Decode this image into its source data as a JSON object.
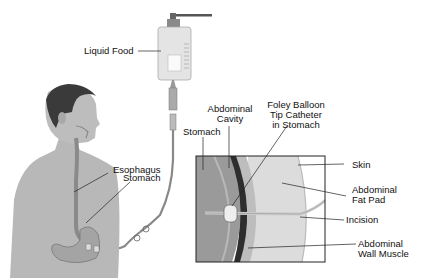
{
  "diagram": {
    "type": "medical-illustration"
  },
  "labels": {
    "liquid_food": "Liquid Food",
    "esophagus": "Esophagus",
    "stomach_body": "Stomach",
    "stomach_inset": "Stomach",
    "abdominal_cavity_1": "Abdominal",
    "abdominal_cavity_2": "Cavity",
    "foley_1": "Foley Balloon",
    "foley_2": "Tip Catheter",
    "foley_3": "in Stomach",
    "skin": "Skin",
    "fat_pad_1": "Abdominal",
    "fat_pad_2": "Fat Pad",
    "incision": "Incision",
    "wall_muscle_1": "Abdominal",
    "wall_muscle_2": "Wall Muscle"
  },
  "colors": {
    "skin_tone": "#b8b8b8",
    "hair": "#3a3a3a",
    "stomach": "#9a9a9a",
    "fat_pad": "#dcdcdc",
    "muscle": "#2e2e2e",
    "line": "#222222"
  }
}
